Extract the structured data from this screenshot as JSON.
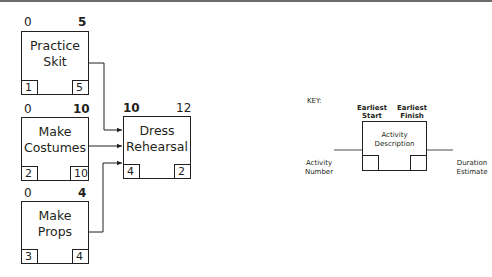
{
  "diagram": {
    "type": "activity-on-node network",
    "activities": [
      {
        "id": "practice-skit",
        "description_line1": "Practice",
        "description_line2": "Skit",
        "earliest_start": "0",
        "earliest_finish": "5",
        "activity_number": "1",
        "duration": "5"
      },
      {
        "id": "make-costumes",
        "description_line1": "Make",
        "description_line2": "Costumes",
        "earliest_start": "0",
        "earliest_finish": "10",
        "activity_number": "2",
        "duration": "10"
      },
      {
        "id": "make-props",
        "description_line1": "Make",
        "description_line2": "Props",
        "earliest_start": "0",
        "earliest_finish": "4",
        "activity_number": "3",
        "duration": "4"
      },
      {
        "id": "dress-rehearsal",
        "description_line1": "Dress",
        "description_line2": "Rehearsal",
        "earliest_start": "10",
        "earliest_finish": "12",
        "activity_number": "4",
        "duration": "2"
      }
    ],
    "edges": [
      {
        "from": "practice-skit",
        "to": "dress-rehearsal"
      },
      {
        "from": "make-costumes",
        "to": "dress-rehearsal"
      },
      {
        "from": "make-props",
        "to": "dress-rehearsal"
      }
    ]
  },
  "key": {
    "title": "KEY:",
    "earliest_start_line1": "Earliest",
    "earliest_start_line2": "Start",
    "earliest_finish_line1": "Earliest",
    "earliest_finish_line2": "Finish",
    "description_line1": "Activity",
    "description_line2": "Description",
    "activity_number_line1": "Activity",
    "activity_number_line2": "Number",
    "duration_line1": "Duration",
    "duration_line2": "Estimate"
  },
  "colors": {
    "line": "#231f20",
    "top_rule": "#6b6b6b",
    "background": "#ffffff"
  }
}
